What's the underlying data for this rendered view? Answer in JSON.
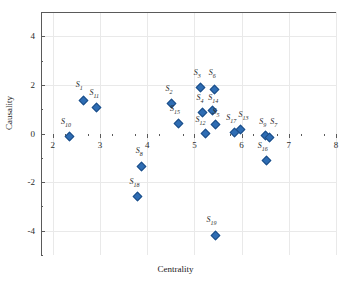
{
  "chart_data": {
    "type": "scatter",
    "title": "",
    "xlabel": "Centrality",
    "ylabel": "Causality",
    "xlim": [
      1.75,
      8.0
    ],
    "ylim": [
      -5.0,
      5.0
    ],
    "x_ticks": [
      2,
      3,
      4,
      5,
      6,
      7,
      8
    ],
    "y_ticks": [
      4,
      2,
      0,
      -2,
      -4
    ],
    "x_tick_labels": [
      "2",
      "3",
      "4",
      "5",
      "6",
      "7",
      "8"
    ],
    "y_tick_labels": [
      "4",
      "2",
      "0",
      "-2",
      "-4"
    ],
    "grid": true,
    "legend": "none",
    "marker": "diamond",
    "marker_color": "#2e6db4",
    "points": [
      {
        "label": "S",
        "sub": "1",
        "x": 2.64,
        "y": 1.37,
        "lx": 2.56,
        "ly": 1.95
      },
      {
        "label": "S",
        "sub": "11",
        "x": 2.93,
        "y": 1.05,
        "lx": 2.88,
        "ly": 1.62
      },
      {
        "label": "S",
        "sub": "10",
        "x": 2.36,
        "y": -0.12,
        "lx": 2.28,
        "ly": 0.44
      },
      {
        "label": "S",
        "sub": "8",
        "x": 3.88,
        "y": -1.35,
        "lx": 3.83,
        "ly": -0.78
      },
      {
        "label": "S",
        "sub": "18",
        "x": 3.79,
        "y": -2.6,
        "lx": 3.73,
        "ly": -2.03
      },
      {
        "label": "S",
        "sub": "2",
        "x": 4.52,
        "y": 1.22,
        "lx": 4.46,
        "ly": 1.78
      },
      {
        "label": "S",
        "sub": "15",
        "x": 4.66,
        "y": 0.4,
        "lx": 4.59,
        "ly": 0.97
      },
      {
        "label": "S",
        "sub": "3",
        "x": 5.12,
        "y": 1.9,
        "lx": 5.06,
        "ly": 2.45
      },
      {
        "label": "S",
        "sub": "6",
        "x": 5.42,
        "y": 1.8,
        "lx": 5.38,
        "ly": 2.45
      },
      {
        "label": "S",
        "sub": "4",
        "x": 5.18,
        "y": 0.88,
        "lx": 5.12,
        "ly": 1.44
      },
      {
        "label": "S",
        "sub": "14",
        "x": 5.38,
        "y": 0.95,
        "lx": 5.4,
        "ly": 1.44
      },
      {
        "label": "S",
        "sub": "12",
        "x": 5.24,
        "y": 0.0,
        "lx": 5.13,
        "ly": 0.5
      },
      {
        "label": "S",
        "sub": "5",
        "x": 5.45,
        "y": 0.35,
        "lx": 5.46,
        "ly": 0.86
      },
      {
        "label": "S",
        "sub": "17",
        "x": 5.85,
        "y": 0.03,
        "lx": 5.78,
        "ly": 0.58
      },
      {
        "label": "S",
        "sub": "13",
        "x": 5.97,
        "y": 0.18,
        "lx": 6.04,
        "ly": 0.7
      },
      {
        "label": "S",
        "sub": "9",
        "x": 6.5,
        "y": -0.09,
        "lx": 6.45,
        "ly": 0.45
      },
      {
        "label": "S",
        "sub": "7",
        "x": 6.6,
        "y": -0.18,
        "lx": 6.68,
        "ly": 0.42
      },
      {
        "label": "S",
        "sub": "16",
        "x": 6.53,
        "y": -1.1,
        "lx": 6.45,
        "ly": -0.55
      },
      {
        "label": "S",
        "sub": "19",
        "x": 5.45,
        "y": -4.18,
        "lx": 5.36,
        "ly": -3.62
      }
    ]
  }
}
